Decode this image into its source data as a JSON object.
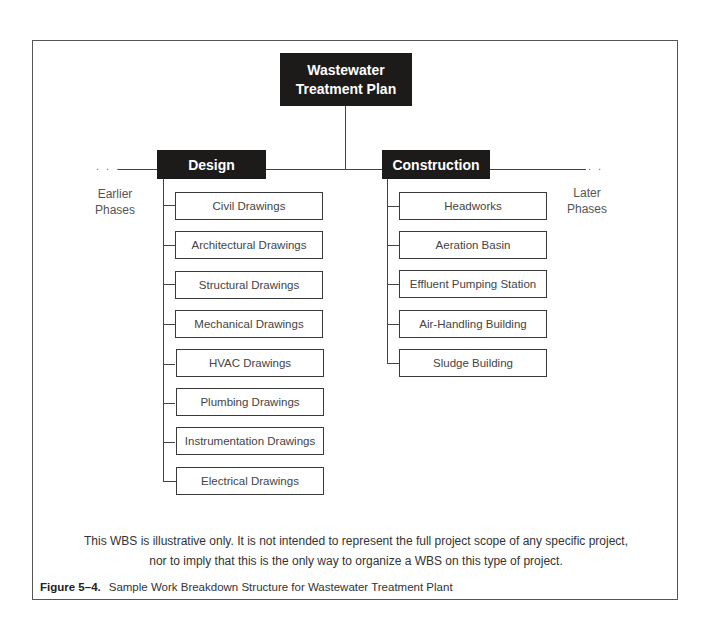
{
  "diagram": {
    "root": {
      "line1": "Wastewater",
      "line2": "Treatment Plan"
    },
    "left_phase": {
      "line1": "Earlier",
      "line2": "Phases",
      "dots": ". . ."
    },
    "right_phase": {
      "line1": "Later",
      "line2": "Phases",
      "dots": ". ."
    },
    "branches": [
      {
        "label": "Design",
        "children": [
          "Civil Drawings",
          "Architectural Drawings",
          "Structural Drawings",
          "Mechanical Drawings",
          "HVAC Drawings",
          "Plumbing Drawings",
          "Instrumentation Drawings",
          "Electrical Drawings"
        ]
      },
      {
        "label": "Construction",
        "children": [
          "Headworks",
          "Aeration Basin",
          "Effluent Pumping Station",
          "Air-Handling Building",
          "Sludge Building"
        ]
      }
    ]
  },
  "note": {
    "line1": "This WBS is illustrative only. It is not intended to represent the full project scope of any specific project,",
    "line2": "nor to imply that this is the only way to organize a WBS on this type of project."
  },
  "caption": {
    "label": "Figure 5–4.",
    "text": "Sample Work Breakdown Structure for Wastewater Treatment Plant"
  }
}
